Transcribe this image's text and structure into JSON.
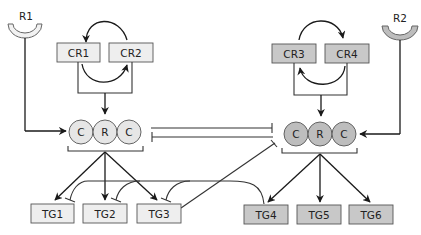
{
  "diagram": {
    "colors": {
      "light_box": "#eeeeee",
      "dark_box": "#c8c8c8",
      "light_circle": "#e6e6e6",
      "dark_circle": "#bdbdbd",
      "receptor_light": "#f2f2f2",
      "receptor_dark": "#bdbdbd",
      "stroke": "#1a1a1a"
    },
    "receptors": [
      {
        "id": "R1",
        "label": "R1"
      },
      {
        "id": "R2",
        "label": "R2"
      }
    ],
    "coregulators": [
      {
        "id": "CR1",
        "label": "CR1",
        "group": "left"
      },
      {
        "id": "CR2",
        "label": "CR2",
        "group": "left"
      },
      {
        "id": "CR3",
        "label": "CR3",
        "group": "right"
      },
      {
        "id": "CR4",
        "label": "CR4",
        "group": "right"
      }
    ],
    "complexes": [
      {
        "id": "left-complex",
        "members": [
          "C",
          "R",
          "C"
        ]
      },
      {
        "id": "right-complex",
        "members": [
          "C",
          "R",
          "C"
        ]
      }
    ],
    "target_genes": [
      {
        "id": "TG1",
        "label": "TG1",
        "group": "left"
      },
      {
        "id": "TG2",
        "label": "TG2",
        "group": "left"
      },
      {
        "id": "TG3",
        "label": "TG3",
        "group": "left"
      },
      {
        "id": "TG4",
        "label": "TG4",
        "group": "right"
      },
      {
        "id": "TG5",
        "label": "TG5",
        "group": "right"
      },
      {
        "id": "TG6",
        "label": "TG6",
        "group": "right"
      }
    ],
    "edges": [
      {
        "from": "R1",
        "to": "left-complex",
        "type": "activation"
      },
      {
        "from": "R2",
        "to": "right-complex",
        "type": "activation"
      },
      {
        "from": "CR1/CR2",
        "to": "left-complex",
        "type": "activation"
      },
      {
        "from": "CR3/CR4",
        "to": "right-complex",
        "type": "activation"
      },
      {
        "from": "CR1",
        "to": "CR2",
        "type": "cycle"
      },
      {
        "from": "CR3",
        "to": "CR4",
        "type": "cycle"
      },
      {
        "from": "left-complex",
        "to": "right-complex",
        "type": "mutual-inhibition"
      },
      {
        "from": "left-complex",
        "to": "TG1",
        "type": "activation"
      },
      {
        "from": "left-complex",
        "to": "TG2",
        "type": "activation"
      },
      {
        "from": "left-complex",
        "to": "TG3",
        "type": "activation"
      },
      {
        "from": "right-complex",
        "to": "TG4",
        "type": "activation"
      },
      {
        "from": "right-complex",
        "to": "TG5",
        "type": "activation"
      },
      {
        "from": "right-complex",
        "to": "TG6",
        "type": "activation"
      },
      {
        "from": "TG4",
        "to": "TG1",
        "type": "inhibition"
      },
      {
        "from": "TG4",
        "to": "TG2",
        "type": "inhibition"
      },
      {
        "from": "TG4",
        "to": "TG3",
        "type": "inhibition"
      },
      {
        "from": "TG3",
        "to": "right-complex",
        "type": "inhibition"
      }
    ]
  }
}
